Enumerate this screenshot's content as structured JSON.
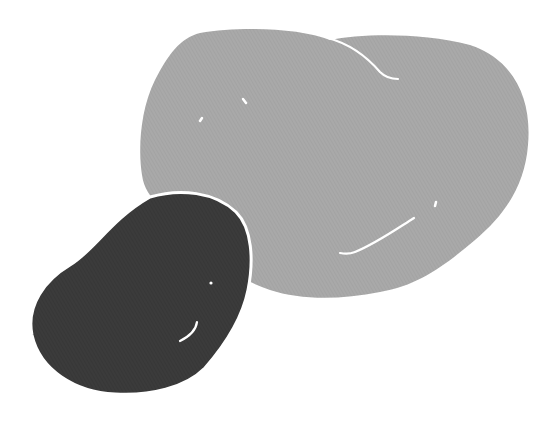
{
  "illustration": {
    "description": "Two potato-shaped blobs",
    "colors": {
      "background": "#ffffff",
      "large_blob": "#a8a8a8",
      "small_blob": "#3a3a3a",
      "highlight": "#ffffff"
    }
  }
}
